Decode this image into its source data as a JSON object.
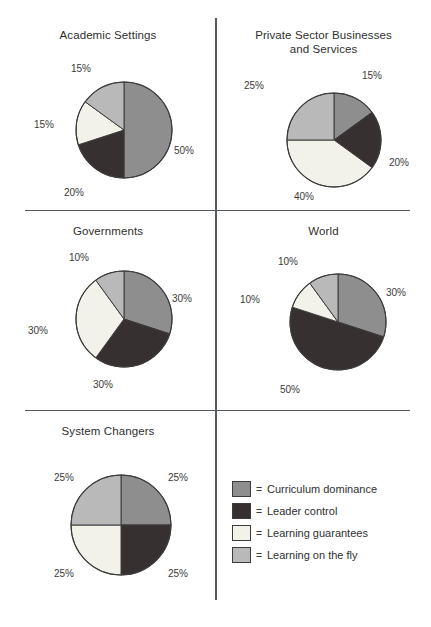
{
  "figure": {
    "background": "#ffffff",
    "rule_color": "#555a5e"
  },
  "palette": {
    "curriculum_dominance": "#8e8e8e",
    "leader_control": "#363130",
    "learning_guarantees": "#f2f1ea",
    "learning_on_the_fly": "#b9b9b9",
    "outline": "#3c3c3c"
  },
  "legend": {
    "equals_sign": "=",
    "items": [
      {
        "label": "Curriculum dominance",
        "color": "#8e8e8e"
      },
      {
        "label": "Leader control",
        "color": "#363130"
      },
      {
        "label": "Learning guarantees",
        "color": "#f2f1ea"
      },
      {
        "label": "Learning on the fly",
        "color": "#b9b9b9"
      }
    ]
  },
  "chart_data": [
    {
      "type": "pie",
      "title": "Academic Settings",
      "start_angle": 0,
      "direction": "clockwise",
      "categories": [
        "Curriculum dominance",
        "Leader control",
        "Learning guarantees",
        "Learning on the fly"
      ],
      "values": [
        50,
        20,
        15,
        15
      ],
      "labels": [
        "50%",
        "20%",
        "15%",
        "15%"
      ],
      "colors": [
        "#8e8e8e",
        "#363130",
        "#f2f1ea",
        "#b9b9b9"
      ]
    },
    {
      "type": "pie",
      "title": "Private Sector Businesses\nand Services",
      "start_angle": 0,
      "direction": "clockwise",
      "categories": [
        "Curriculum dominance",
        "Leader control",
        "Learning guarantees",
        "Learning on the fly"
      ],
      "values": [
        15,
        20,
        40,
        25
      ],
      "labels": [
        "15%",
        "20%",
        "40%",
        "25%"
      ],
      "colors": [
        "#8e8e8e",
        "#363130",
        "#f2f1ea",
        "#b9b9b9"
      ]
    },
    {
      "type": "pie",
      "title": "Governments",
      "start_angle": 0,
      "direction": "clockwise",
      "categories": [
        "Curriculum dominance",
        "Leader control",
        "Learning guarantees",
        "Learning on the fly"
      ],
      "values": [
        30,
        30,
        30,
        10
      ],
      "labels": [
        "30%",
        "30%",
        "30%",
        "10%"
      ],
      "colors": [
        "#8e8e8e",
        "#363130",
        "#f2f1ea",
        "#b9b9b9"
      ]
    },
    {
      "type": "pie",
      "title": "World",
      "start_angle": 0,
      "direction": "clockwise",
      "categories": [
        "Curriculum dominance",
        "Leader control",
        "Learning guarantees",
        "Learning on the fly"
      ],
      "values": [
        30,
        50,
        10,
        10
      ],
      "labels": [
        "30%",
        "50%",
        "10%",
        "10%"
      ],
      "colors": [
        "#8e8e8e",
        "#363130",
        "#f2f1ea",
        "#b9b9b9"
      ]
    },
    {
      "type": "pie",
      "title": "System Changers",
      "start_angle": 0,
      "direction": "clockwise",
      "categories": [
        "Curriculum dominance",
        "Leader control",
        "Learning guarantees",
        "Learning on the fly"
      ],
      "values": [
        25,
        25,
        25,
        25
      ],
      "labels": [
        "25%",
        "25%",
        "25%",
        "25%"
      ],
      "colors": [
        "#8e8e8e",
        "#363130",
        "#f2f1ea",
        "#b9b9b9"
      ]
    }
  ],
  "panels": [
    {
      "name": "academic-settings",
      "title_key": 0,
      "box": {
        "left": 0,
        "top": 22,
        "width": 216,
        "height": 188
      },
      "title_top": 6,
      "pie": {
        "cx": 124,
        "cy": 108,
        "r": 48
      },
      "label_positions": [
        {
          "text": "50%",
          "left": 174,
          "top": 123
        },
        {
          "text": "20%",
          "left": 64,
          "top": 165
        },
        {
          "text": "15%",
          "left": 34,
          "top": 97
        },
        {
          "text": "15%",
          "left": 71,
          "top": 41
        }
      ]
    },
    {
      "name": "private-sector-businesses-and-services",
      "title_key": 1,
      "box": {
        "left": 216,
        "top": 22,
        "width": 215,
        "height": 188
      },
      "title_top": 6,
      "pie": {
        "cx": 118,
        "cy": 118,
        "r": 47
      },
      "label_positions": [
        {
          "text": "15%",
          "left": 146,
          "top": 48
        },
        {
          "text": "20%",
          "left": 173,
          "top": 135
        },
        {
          "text": "40%",
          "left": 78,
          "top": 169
        },
        {
          "text": "25%",
          "left": 28,
          "top": 58
        }
      ]
    },
    {
      "name": "governments",
      "title_key": 2,
      "box": {
        "left": 0,
        "top": 212,
        "width": 216,
        "height": 198
      },
      "title_top": 12,
      "pie": {
        "cx": 124,
        "cy": 107,
        "r": 48
      },
      "label_positions": [
        {
          "text": "30%",
          "left": 172,
          "top": 81
        },
        {
          "text": "30%",
          "left": 93,
          "top": 167
        },
        {
          "text": "30%",
          "left": 28,
          "top": 113
        },
        {
          "text": "10%",
          "left": 69,
          "top": 40
        }
      ]
    },
    {
      "name": "world",
      "title_key": 3,
      "box": {
        "left": 216,
        "top": 212,
        "width": 215,
        "height": 198
      },
      "title_top": 12,
      "pie": {
        "cx": 122,
        "cy": 110,
        "r": 48
      },
      "label_positions": [
        {
          "text": "30%",
          "left": 170,
          "top": 75
        },
        {
          "text": "50%",
          "left": 64,
          "top": 172
        },
        {
          "text": "10%",
          "left": 24,
          "top": 82
        },
        {
          "text": "10%",
          "left": 62,
          "top": 44
        }
      ]
    },
    {
      "name": "system-changers",
      "title_key": 4,
      "box": {
        "left": 0,
        "top": 412,
        "width": 216,
        "height": 200
      },
      "title_top": 12,
      "pie": {
        "cx": 121,
        "cy": 113,
        "r": 50
      },
      "label_positions": [
        {
          "text": "25%",
          "left": 168,
          "top": 60
        },
        {
          "text": "25%",
          "left": 168,
          "top": 156
        },
        {
          "text": "25%",
          "left": 54,
          "top": 156
        },
        {
          "text": "25%",
          "left": 54,
          "top": 60
        }
      ]
    }
  ],
  "rules": {
    "horizontal": [
      {
        "left": 25,
        "top": 210,
        "width": 385
      },
      {
        "left": 25,
        "top": 410,
        "width": 385
      }
    ],
    "vertical": [
      {
        "left": 215,
        "top": 18,
        "height": 582
      }
    ]
  },
  "legend_box": {
    "left": 232,
    "top": 478
  }
}
